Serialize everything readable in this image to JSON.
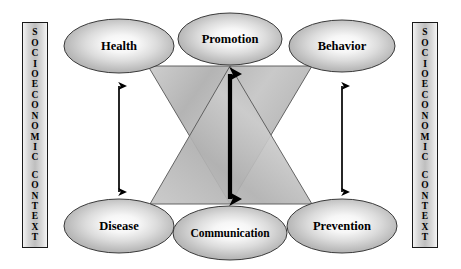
{
  "diagram": {
    "type": "conceptual-relationship-diagram",
    "background_color": "#ffffff"
  },
  "context_bars": {
    "text": "SOCIOECONOMIC CONTEXT",
    "orientation": "vertical-stacked-letters",
    "words": [
      "SOCIOECONOMIC",
      "CONTEXT"
    ],
    "letters": [
      "S",
      "O",
      "C",
      "I",
      "O",
      "E",
      "C",
      "O",
      "N",
      "O",
      "M",
      "I",
      "C",
      "",
      "C",
      "O",
      "N",
      "T",
      "E",
      "X",
      "T"
    ],
    "left": {
      "label": "SOCIOECONOMIC CONTEXT"
    },
    "right": {
      "label": "SOCIOECONOMIC CONTEXT"
    },
    "fill_color": "#cfcfcf",
    "border_color": "#1a1a1a"
  },
  "nodes": {
    "top_row": [
      {
        "id": "health",
        "label": "Health"
      },
      {
        "id": "promotion",
        "label": "Promotion"
      },
      {
        "id": "behavior",
        "label": "Behavior"
      }
    ],
    "bottom_row": [
      {
        "id": "disease",
        "label": "Disease"
      },
      {
        "id": "communication",
        "label": "Communication"
      },
      {
        "id": "prevention",
        "label": "Prevention"
      }
    ],
    "fill_center_color": "#fdfdfd",
    "fill_edge_color": "#a8a8a8",
    "border_color": "#3a3a3a"
  },
  "connectors": {
    "arrows": [
      {
        "id": "health-disease",
        "from": "Health",
        "to": "Disease",
        "style": "double-headed-vertical"
      },
      {
        "id": "promotion-communication",
        "from": "Promotion",
        "to": "Communication",
        "style": "double-headed-vertical-bold"
      },
      {
        "id": "behavior-prevention",
        "from": "Behavior",
        "to": "Prevention",
        "style": "double-headed-vertical"
      }
    ],
    "arrow_color": "#000000"
  },
  "triangles": {
    "description": "Two overlapping shaded triangles forming an hourglass between the node rows",
    "items": [
      {
        "id": "downward-triangle",
        "apex": "bottom-center",
        "base": "top"
      },
      {
        "id": "upward-triangle",
        "apex": "top-center",
        "base": "bottom"
      }
    ],
    "fill_color": "#b9b9b9",
    "border_color": "#555555"
  }
}
